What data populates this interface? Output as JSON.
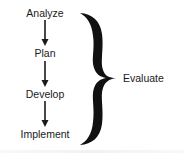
{
  "diagram": {
    "steps": [
      {
        "label": "Analyze"
      },
      {
        "label": "Plan"
      },
      {
        "label": "Develop"
      },
      {
        "label": "Implement"
      }
    ],
    "connectors": [
      "arrow-down",
      "arrow-down",
      "arrow-down"
    ],
    "grouping": {
      "type": "curly-brace",
      "label": "Evaluate"
    },
    "colors": {
      "ink": "#1a1a1a",
      "background": "#ffffff"
    }
  }
}
